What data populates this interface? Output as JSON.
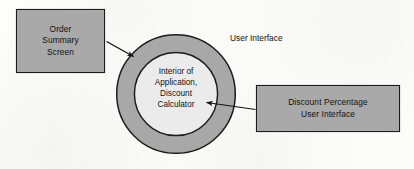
{
  "diagram": {
    "background_color": "#fdfdfc",
    "boxes": [
      {
        "id": "order-summary-screen",
        "label": "Order\nSummary\nScreen",
        "fill_color": "#a9a9a9",
        "border_color": "#1c1c1c"
      },
      {
        "id": "discount-percentage-user-interface",
        "label": "Discount Percentage\nUser Interface",
        "fill_color": "#a9a9a9",
        "border_color": "#1c1c1c"
      }
    ],
    "circle": {
      "outer_label": "User Interface",
      "inner_label": "Interior of\nApplication,\nDiscount\nCalculator",
      "ring_fill_color": "#a8a8a8",
      "inner_fill_color": "#ebebeb",
      "outline_color": "#1c1c1c",
      "center_x": 176,
      "center_y": 94,
      "outer_radius": 60,
      "inner_radius": 42
    },
    "arrows": [
      {
        "id": "order-summary-to-ring",
        "from": "order-summary-screen",
        "to": "user-interface-ring",
        "color": "#111111"
      },
      {
        "id": "discount-pct-to-interior",
        "from": "discount-percentage-user-interface",
        "to": "interior-of-application",
        "color": "#111111"
      }
    ]
  }
}
